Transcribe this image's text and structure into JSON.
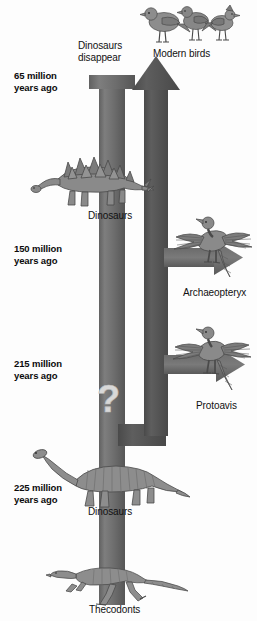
{
  "figure": {
    "background_color": "#fdfdfd"
  },
  "colors": {
    "dinosaur_arrow": "#767676",
    "bird_arrow": "#555555",
    "branch_arrow": "#6f6f6f",
    "text": "#111111",
    "creature_fill": "#8b8b8b",
    "creature_stroke": "#4a4a4a"
  },
  "timeline": {
    "ages": [
      {
        "id": "age-65",
        "line1": "65 million",
        "line2": "years ago",
        "x": 14,
        "y": 70
      },
      {
        "id": "age-150",
        "line1": "150 million",
        "line2": "years ago",
        "x": 14,
        "y": 243
      },
      {
        "id": "age-215",
        "line1": "215 million",
        "line2": "years ago",
        "x": 14,
        "y": 358
      },
      {
        "id": "age-225",
        "line1": "225 million",
        "line2": "years ago",
        "x": 14,
        "y": 482
      }
    ]
  },
  "captions": {
    "dinosaurs_disappear": {
      "line1": "Dinosaurs",
      "line2": "disappear",
      "x": 78,
      "y": 40
    },
    "modern_birds": {
      "text": "Modern birds",
      "x": 153,
      "y": 48
    },
    "dinosaurs_mid": {
      "text": "Dinosaurs",
      "x": 88,
      "y": 210
    },
    "archaeopteryx": {
      "text": "Archaeopteryx",
      "x": 183,
      "y": 287
    },
    "protoavis": {
      "text": "Protoavis",
      "x": 196,
      "y": 400
    },
    "dinosaurs_lower": {
      "text": "Dinosaurs",
      "x": 88,
      "y": 506
    },
    "thecodonts": {
      "text": "Thecodonts",
      "x": 89,
      "y": 606
    }
  },
  "creatures": [
    {
      "id": "modern-birds",
      "name": "modern-birds-illustration",
      "label": "Modern birds"
    },
    {
      "id": "stegosaurus",
      "name": "stegosaurus-illustration",
      "label": "Dinosaurs"
    },
    {
      "id": "archaeopteryx",
      "name": "archaeopteryx-illustration",
      "label": "Archaeopteryx"
    },
    {
      "id": "protoavis",
      "name": "protoavis-illustration",
      "label": "Protoavis"
    },
    {
      "id": "sauropod",
      "name": "sauropod-illustration",
      "label": "Dinosaurs"
    },
    {
      "id": "thecodont",
      "name": "thecodont-illustration",
      "label": "Thecodonts"
    }
  ],
  "markers": {
    "question_mark": {
      "glyph": "?",
      "x": 97,
      "y": 385
    }
  }
}
